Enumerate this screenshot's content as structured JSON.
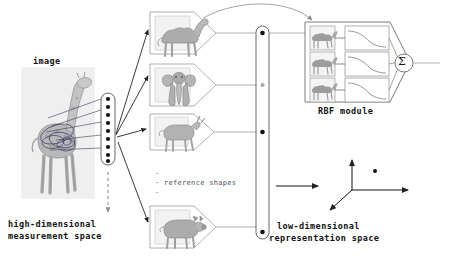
{
  "figure": {
    "type": "diagram",
    "title_present": false,
    "background": "#ffffff",
    "stroke_color": "#444444",
    "text_color": "#111111"
  },
  "labels": {
    "image": "image",
    "high_dimensional": "high-dimensional",
    "measurement_space": "measurement space",
    "reference_shapes": "reference shapes",
    "rbf_module": "RBF module",
    "low_dimensional": "low-dimensional",
    "representation_space": "representation space",
    "sigma": "Σ",
    "ellipsis_dot": "·"
  },
  "input": {
    "name": "giraffe-photograph",
    "caption": "image",
    "annotation": "contour and ellipse overlays on the giraffe body",
    "x": 22,
    "y": 68,
    "w": 72,
    "h": 130
  },
  "measurement_capsule": {
    "name": "high-dimensional-feature-vector",
    "dot_count": 9,
    "x": 101,
    "y": 93,
    "w": 14,
    "h": 72,
    "dashed_arrow_below": true
  },
  "reference_shapes": [
    {
      "id": 1,
      "name": "camel-side-view",
      "label": "camel",
      "x": 150,
      "y": 12,
      "w": 44,
      "h": 42
    },
    {
      "id": 2,
      "name": "elephant-front-view",
      "label": "elephant",
      "x": 150,
      "y": 64,
      "w": 44,
      "h": 42
    },
    {
      "id": 3,
      "name": "goat-side-view",
      "label": "goat",
      "x": 150,
      "y": 114,
      "w": 44,
      "h": 36
    },
    {
      "id": 4,
      "name": "pig-side-view",
      "label": "pig",
      "x": 150,
      "y": 206,
      "w": 44,
      "h": 40
    }
  ],
  "representation_capsule": {
    "name": "low-dimensional-feature-vector",
    "dot_count": 4,
    "dot_states": [
      "filled",
      "faint",
      "filled",
      "filled"
    ],
    "x": 256,
    "y": 26,
    "w": 13,
    "h": 213
  },
  "rbf_module": {
    "name": "rbf-module",
    "caption": "RBF module",
    "x": 305,
    "y": 22,
    "w": 100,
    "h": 80,
    "rows": 3,
    "row_items": [
      {
        "thumb": "camel-thumbnail-1",
        "curve": "sigmoid-decreasing-1"
      },
      {
        "thumb": "camel-thumbnail-2",
        "curve": "sigmoid-decreasing-2"
      },
      {
        "thumb": "camel-thumbnail-3",
        "curve": "sigmoid-decreasing-3"
      }
    ],
    "summation_node": "Σ"
  },
  "axes": {
    "name": "low-dimensional-axes",
    "origin_x": 352,
    "origin_y": 190,
    "axis_y_tip": [
      352,
      156
    ],
    "axis_x_tip": [
      412,
      190
    ],
    "axis_z_tip": [
      327,
      212
    ],
    "point": {
      "x": 375,
      "y": 171,
      "label": ""
    }
  },
  "connectors": {
    "giraffe_to_capsule": 5,
    "capsule_to_shapes": 4,
    "shapes_to_capsule": 4,
    "curved_top_arrow": true,
    "capsule_to_rbf": true,
    "rbf_out": true,
    "capsule_to_axes_arrow": true
  }
}
